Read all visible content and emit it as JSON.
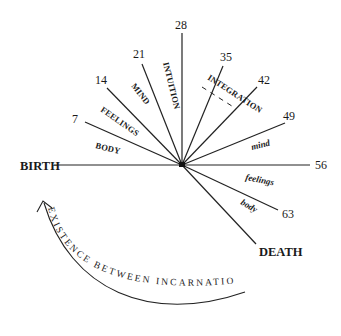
{
  "diagram": {
    "type": "radial life-cycle diagram",
    "center": {
      "x": 182,
      "y": 165
    },
    "start_label": "BIRTH",
    "end_label": "DEATH",
    "age_markers": [
      "7",
      "14",
      "21",
      "28",
      "35",
      "42",
      "49",
      "56",
      "63"
    ],
    "phase_labels_ascending": {
      "body": "BODY",
      "feelings": "FEELINGS",
      "mind": "MIND",
      "intuition": "INTUITION",
      "integration": "INTEGRATION"
    },
    "phase_labels_descending": {
      "mind": "mind",
      "feelings": "feelings",
      "body": "body"
    },
    "cycle_arrow_label": "EXISTENCE BETWEEN INCARNATIONS",
    "colors": {
      "ink": "#1a1a1a",
      "background": "#ffffff"
    }
  }
}
